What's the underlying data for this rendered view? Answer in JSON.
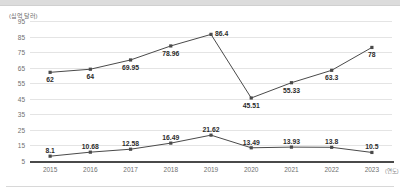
{
  "chart_data": {
    "type": "line",
    "title": "",
    "xlabel": "연도",
    "ylabel": "십억 달러",
    "y_unit_label": "(십억 달러)",
    "x_unit_label": "(연도)",
    "categories": [
      "2015",
      "2016",
      "2017",
      "2018",
      "2019",
      "2020",
      "2021",
      "2022",
      "2023"
    ],
    "ylim": [
      5,
      95
    ],
    "yticks": [
      95,
      85,
      75,
      65,
      55,
      45,
      35,
      25,
      15,
      5
    ],
    "grid": true,
    "legend": "none",
    "series": [
      {
        "name": "upper-series",
        "values": [
          62,
          64,
          69.95,
          78.96,
          86.4,
          45.51,
          55.33,
          63.3,
          78
        ],
        "labels": [
          "62",
          "64",
          "69.95",
          "78.96",
          "86.4",
          "45.51",
          "55.33",
          "63.3",
          "78"
        ],
        "color": "#4a4a4a"
      },
      {
        "name": "lower-series",
        "values": [
          8.1,
          10.68,
          12.58,
          16.49,
          21.62,
          13.49,
          13.93,
          13.8,
          10.5
        ],
        "labels": [
          "8.1",
          "10.68",
          "12.58",
          "16.49",
          "21.62",
          "13.49",
          "13.93",
          "13.8",
          "10.5"
        ],
        "color": "#4a4a4a"
      }
    ]
  }
}
